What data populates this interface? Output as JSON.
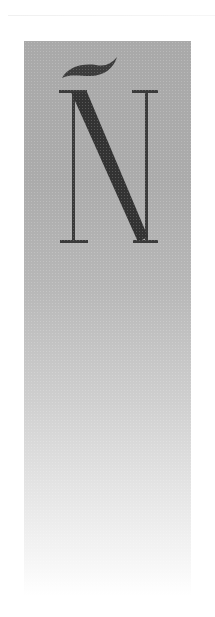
{
  "artwork": {
    "letter": "Ñ",
    "description": "Decorative serif capital N with tilde on a grey gradient panel",
    "colors": {
      "panel_top": "#a9a9a9",
      "panel_bottom": "#ffffff",
      "glyph": "#3a3a3a"
    }
  }
}
